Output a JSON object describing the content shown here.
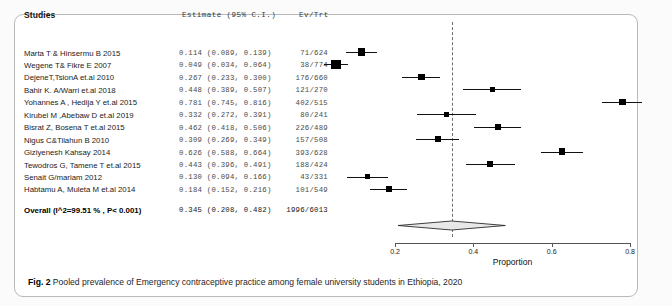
{
  "figure": {
    "caption_label": "Fig. 2",
    "caption_text": "Pooled prevalence of Emergency contraceptive practice among female university students in Ethiopia, 2020"
  },
  "table": {
    "headers": {
      "studies": "Studies",
      "estimate": "Estimate (95% C.I.)",
      "events": "Ev/Trt"
    }
  },
  "chart_data": {
    "type": "forest",
    "title": "Pooled prevalence of Emergency contraceptive practice among female university students in Ethiopia, 2020",
    "xlabel": "Proportion",
    "ylabel": "",
    "xlim": [
      0.2,
      0.8
    ],
    "xticks": [
      0.2,
      0.4,
      0.6,
      0.8
    ],
    "xticklabels": [
      "0.2",
      "0.4",
      "0.6",
      "0.8"
    ],
    "grid": false,
    "reference_line": 0.345,
    "effect_measure": "Proportion",
    "heterogeneity": "I^2=99.51 %",
    "pvalue": "P< 0.001",
    "studies": [
      {
        "label": "Marta T & Hinsermu B 2015",
        "estimate": 0.114,
        "ci_low": 0.089,
        "ci_high": 0.139,
        "estimate_text": "0.114 (0.089, 0.139)",
        "events": "71/624",
        "ev": 71,
        "trt": 624
      },
      {
        "label": "Wegene T& Fikre E 2007",
        "estimate": 0.049,
        "ci_low": 0.034,
        "ci_high": 0.064,
        "estimate_text": "0.049 (0.034, 0.064)",
        "events": "38/774",
        "ev": 38,
        "trt": 774
      },
      {
        "label": "DejeneT,TsionA et.al 2010",
        "estimate": 0.267,
        "ci_low": 0.233,
        "ci_high": 0.3,
        "estimate_text": "0.267 (0.233, 0.300)",
        "events": "176/660",
        "ev": 176,
        "trt": 660
      },
      {
        "label": "Bahir K. A/Warri et.al 2018",
        "estimate": 0.448,
        "ci_low": 0.389,
        "ci_high": 0.507,
        "estimate_text": "0.448 (0.389, 0.507)",
        "events": "121/270",
        "ev": 121,
        "trt": 270
      },
      {
        "label": "Yohannes A , Hedija Y et.al 2015",
        "estimate": 0.781,
        "ci_low": 0.745,
        "ci_high": 0.816,
        "estimate_text": "0.781 (0.745, 0.816)",
        "events": "402/515",
        "ev": 402,
        "trt": 515
      },
      {
        "label": "Kirubel M ,Abebaw D et.al 2019",
        "estimate": 0.332,
        "ci_low": 0.272,
        "ci_high": 0.391,
        "estimate_text": "0.332 (0.272, 0.391)",
        "events": "80/241",
        "ev": 80,
        "trt": 241
      },
      {
        "label": "Bisrat Z, Bosena T et.al 2015",
        "estimate": 0.462,
        "ci_low": 0.418,
        "ci_high": 0.506,
        "estimate_text": "0.462 (0.418, 0.506)",
        "events": "226/489",
        "ev": 226,
        "trt": 489
      },
      {
        "label": "Nigus C&Tilahun B 2010",
        "estimate": 0.309,
        "ci_low": 0.269,
        "ci_high": 0.349,
        "estimate_text": "0.309 (0.269, 0.349)",
        "events": "157/508",
        "ev": 157,
        "trt": 508
      },
      {
        "label": "Giziyenesh Kahsay 2014",
        "estimate": 0.626,
        "ci_low": 0.588,
        "ci_high": 0.664,
        "estimate_text": "0.626 (0.588, 0.664)",
        "events": "393/628",
        "ev": 393,
        "trt": 628
      },
      {
        "label": "Tewodros G, Tamene T et.al 2015",
        "estimate": 0.443,
        "ci_low": 0.396,
        "ci_high": 0.491,
        "estimate_text": "0.443 (0.396, 0.491)",
        "events": "188/424",
        "ev": 188,
        "trt": 424
      },
      {
        "label": "Senait G/mariam 2012",
        "estimate": 0.13,
        "ci_low": 0.094,
        "ci_high": 0.166,
        "estimate_text": "0.130 (0.094, 0.166)",
        "events": "43/331",
        "ev": 43,
        "trt": 331
      },
      {
        "label": "Habtamu A, Muleta M et.al 2014",
        "estimate": 0.184,
        "ci_low": 0.152,
        "ci_high": 0.216,
        "estimate_text": "0.184 (0.152, 0.216)",
        "events": "101/549",
        "ev": 101,
        "trt": 549
      }
    ],
    "overall": {
      "label": "Overall (I^2=99.51 % , P< 0.001)",
      "estimate": 0.345,
      "ci_low": 0.208,
      "ci_high": 0.482,
      "estimate_text": "0.345 (0.208, 0.482)",
      "events": "1996/6013",
      "ev": 1996,
      "trt": 6013
    }
  }
}
